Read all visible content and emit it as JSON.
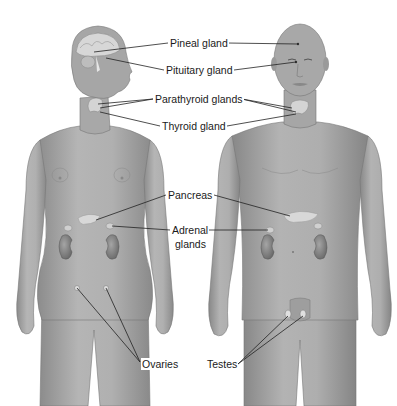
{
  "diagram": {
    "figures": [
      {
        "name": "female",
        "glands_shown": [
          "pineal",
          "pituitary",
          "parathyroid",
          "thyroid",
          "pancreas",
          "adrenal",
          "ovaries"
        ]
      },
      {
        "name": "male",
        "glands_shown": [
          "pineal",
          "pituitary",
          "parathyroid",
          "thyroid",
          "pancreas",
          "adrenal",
          "testes"
        ]
      }
    ],
    "labels": {
      "pineal": "Pineal gland",
      "pituitary": "Pituitary gland",
      "parathyroid": "Parathyroid glands",
      "thyroid": "Thyroid gland",
      "pancreas": "Pancreas",
      "adrenal_line1": "Adrenal",
      "adrenal_line2": "glands",
      "ovaries": "Ovaries",
      "testes": "Testes"
    },
    "colors": {
      "skin": "#a9a9a9",
      "skin_light": "#c8c8c8",
      "skin_dark": "#7d7d7d",
      "kidney": "#8a8a8a",
      "gland": "#d6d6d6",
      "leader_line": "#222222",
      "background": "#ffffff"
    }
  }
}
